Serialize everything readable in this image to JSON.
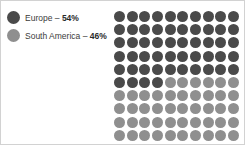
{
  "colors": {
    "primary": "#4a4a4a",
    "secondary": "#8f8f8f",
    "background": "#ffffff",
    "border": "#d2d2d2",
    "text": "#3b3b3b"
  },
  "legend": {
    "items": [
      {
        "swatch_icon": "circle-icon",
        "label": "Europe",
        "separator": " – ",
        "value": "54%",
        "color": "#4a4a4a"
      },
      {
        "swatch_icon": "circle-icon",
        "label": "South America",
        "separator": " – ",
        "value": "46%",
        "color": "#8f8f8f"
      }
    ]
  },
  "chart_data": {
    "type": "pie",
    "subtype": "waffle",
    "title": "",
    "xlabel": "",
    "ylabel": "",
    "grid": {
      "rows": 10,
      "columns": 10,
      "total_units": 100,
      "fill_order": "row-major"
    },
    "legend_position": "top-left",
    "categories": [
      "Europe",
      "South America"
    ],
    "values": [
      54,
      46
    ],
    "unit": "%",
    "series": [
      {
        "name": "Europe",
        "value": 54,
        "units": 54,
        "color": "#4a4a4a"
      },
      {
        "name": "South America",
        "value": 46,
        "units": 46,
        "color": "#8f8f8f"
      }
    ]
  }
}
